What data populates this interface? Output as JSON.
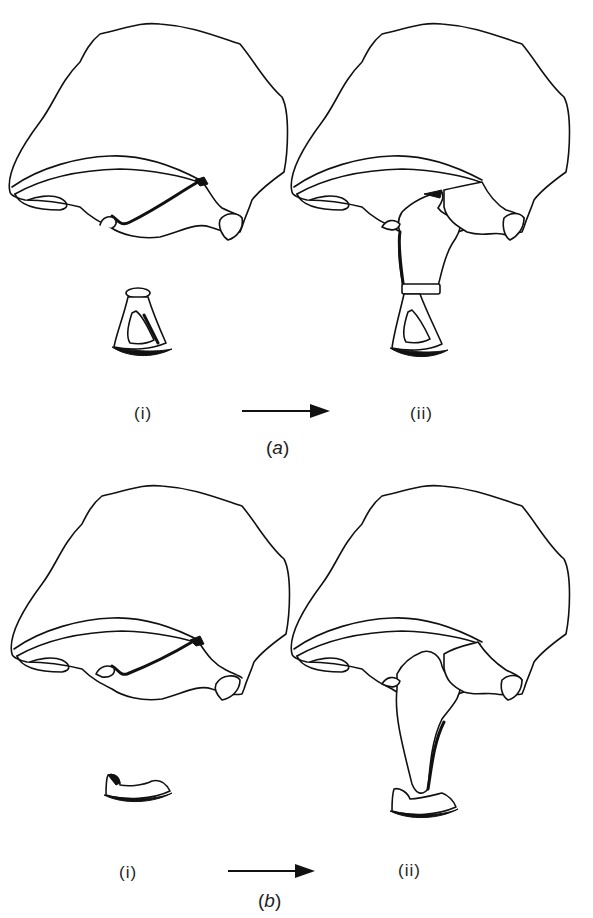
{
  "figure": {
    "panel_a": {
      "caption_open": "(",
      "caption_letter": "a",
      "caption_close": ")",
      "left_label": "(i)",
      "right_label": "(ii)",
      "arrow": "right-arrow"
    },
    "panel_b": {
      "caption_open": "(",
      "caption_letter": "b",
      "caption_close": ")",
      "left_label": "(i)",
      "right_label": "(ii)",
      "arrow": "right-arrow"
    }
  },
  "colors": {
    "ink": "#111111",
    "background": "#ffffff"
  }
}
